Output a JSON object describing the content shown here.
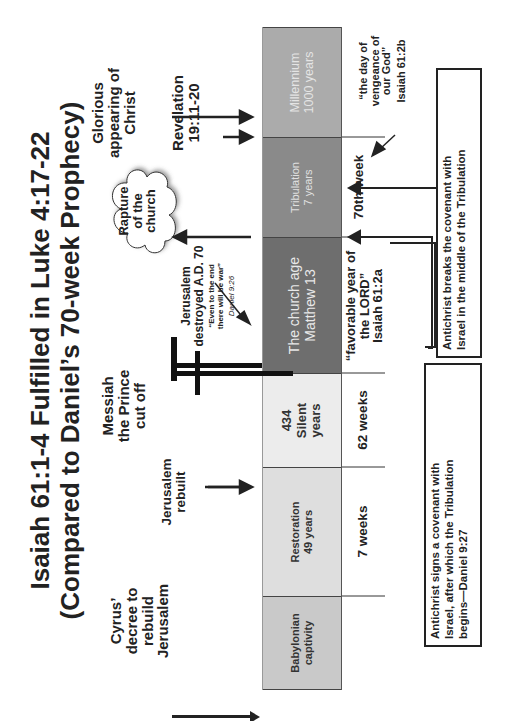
{
  "title": {
    "line1": "Isaiah 61:1-4  Fulfilled in Luke 4:17-22",
    "line2": "(Compared to Daniel’s 70-week Prophecy)"
  },
  "events": {
    "cyrus": [
      "Cyrus’",
      "decree to",
      "rebuild",
      "Jerusalem"
    ],
    "jerusalem_rebuilt": [
      "Jerusalem",
      "rebuilt"
    ],
    "messiah": [
      "Messiah",
      "the Prince",
      "cut off"
    ],
    "jerusalem_destroyed": [
      "Jerusalem",
      "destroyed A.D. 70"
    ],
    "daniel_quote": [
      "“Even to the end",
      "there will be war”"
    ],
    "daniel_ref": "Daniel 9:26",
    "rapture": [
      "Rapture",
      "of the",
      "church"
    ],
    "glorious": [
      "Glorious",
      "appearing of",
      "Christ"
    ],
    "revelation": [
      "Revelation",
      "19:11-20"
    ]
  },
  "timeline": [
    {
      "label": [
        "Babylonian",
        "captivity"
      ],
      "color": "#c9c9c9",
      "text_color": "#333333"
    },
    {
      "label": [
        "Restoration",
        "49 years"
      ],
      "color": "#dedede",
      "text_color": "#333333"
    },
    {
      "label": [
        "434",
        "Silent",
        "years"
      ],
      "color": "#ececec",
      "text_color": "#333333"
    },
    {
      "label": [
        "The church age",
        "Matthew 13"
      ],
      "color": "#6e6e6e",
      "text_color": "#e8e8e8"
    },
    {
      "label": [
        "Tribulation",
        "7 years"
      ],
      "color": "#8a8a8a",
      "text_color": "#e0e0e0"
    },
    {
      "label": [
        "Millennium",
        "1000 years"
      ],
      "color": "#ababab",
      "text_color": "#e4e4e4"
    }
  ],
  "weeks": {
    "seven": "7 weeks",
    "sixty_two": "62 weeks",
    "seventieth": "70th week"
  },
  "isaiah_quotes": {
    "favorable": [
      "“favorable year of",
      "the LORD”",
      "Isaiah  61:2a"
    ],
    "vengeance": [
      "“the day of",
      "vengeance of",
      "our God”",
      "Isaiah 61:2b"
    ]
  },
  "boxes": {
    "signs": [
      "Antichrist signs a covenant with",
      "Israel, after which the Tribulation",
      "begins—Daniel 9:27"
    ],
    "breaks": [
      "Antichrist breaks the covenant with",
      "Israel in the middle of the Tribulation"
    ]
  }
}
